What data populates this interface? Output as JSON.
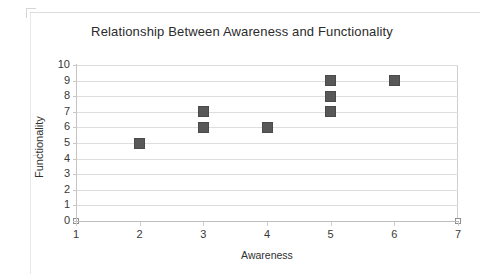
{
  "chart_data": {
    "type": "scatter",
    "title": "Relationship Between Awareness and Functionality",
    "xlabel": "Awareness",
    "ylabel": "Functionality",
    "xlim": [
      1,
      7
    ],
    "ylim": [
      0,
      10
    ],
    "xticks": [
      "1",
      "2",
      "3",
      "4",
      "5",
      "6",
      "7"
    ],
    "yticks": [
      "0",
      "1",
      "2",
      "3",
      "4",
      "5",
      "6",
      "7",
      "8",
      "9",
      "10"
    ],
    "grid": "horizontal",
    "legend": "none",
    "marker_color": "#585858",
    "gridline_color": "#dedede",
    "series": [
      {
        "name": "Awareness vs Functionality",
        "marker": "filled-square",
        "points": [
          {
            "x": 2,
            "y": 5
          },
          {
            "x": 3,
            "y": 7
          },
          {
            "x": 3,
            "y": 6
          },
          {
            "x": 4,
            "y": 6
          },
          {
            "x": 5,
            "y": 9
          },
          {
            "x": 5,
            "y": 8
          },
          {
            "x": 5,
            "y": 7
          },
          {
            "x": 6,
            "y": 9
          }
        ]
      },
      {
        "name": "Axis endpoint markers",
        "marker": "open-square",
        "points": [
          {
            "x": 1,
            "y": 0
          },
          {
            "x": 7,
            "y": 0
          }
        ]
      }
    ]
  }
}
